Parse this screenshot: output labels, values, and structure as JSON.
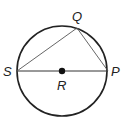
{
  "diagram": {
    "type": "circle-geometry",
    "circle": {
      "center_label": "R",
      "cx": 62,
      "cy": 71,
      "r": 45
    },
    "points": [
      {
        "label": "Q",
        "x": 77,
        "y": 28,
        "label_x": 72,
        "label_y": 21
      },
      {
        "label": "S",
        "x": 17,
        "y": 71,
        "label_x": 3,
        "label_y": 76
      },
      {
        "label": "P",
        "x": 108,
        "y": 71,
        "label_x": 111,
        "label_y": 76
      },
      {
        "label": "R",
        "x": 62,
        "y": 71,
        "label_x": 57,
        "label_y": 90
      }
    ],
    "segments": [
      "SP",
      "SQ",
      "QP"
    ]
  }
}
